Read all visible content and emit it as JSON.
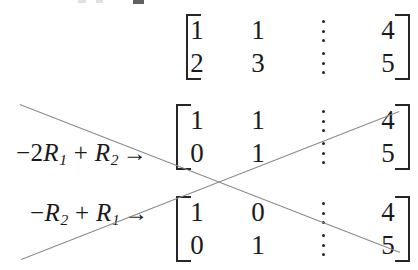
{
  "page": {
    "background_color": "#ffffff",
    "text_color": "#1a1a1a",
    "line_color": "#8a8a8a",
    "bracket_color": "#262626",
    "width": 418,
    "height": 270
  },
  "blocks": [
    {
      "id": "matrix-1",
      "label": "",
      "label_arrow": "",
      "rows": [
        {
          "c1": "1",
          "c2": "1",
          "sep": "dots",
          "c3": "4"
        },
        {
          "c1": "2",
          "c2": "3",
          "sep": "dots",
          "c3": "5"
        }
      ]
    },
    {
      "id": "matrix-2",
      "label_minus": "−",
      "label_coef": "2",
      "label_r_a": "R",
      "label_sub_a": "1",
      "label_plus": "+",
      "label_r_b": "R",
      "label_sub_b": "2",
      "label_arrow": "→",
      "rows": [
        {
          "c1": "1",
          "c2": "1",
          "sep": "dots",
          "c3": "4"
        },
        {
          "c1": "0",
          "c2": "1",
          "sep": "dots",
          "c3": "5"
        }
      ]
    },
    {
      "id": "matrix-3",
      "label_minus": "−",
      "label_coef": "",
      "label_r_a": "R",
      "label_sub_a": "2",
      "label_plus": "+",
      "label_r_b": "R",
      "label_sub_b": "1",
      "label_arrow": "→",
      "rows": [
        {
          "c1": "1",
          "c2": "0",
          "sep": "dots",
          "c3": "4"
        },
        {
          "c1": "0",
          "c2": "1",
          "sep": "dots",
          "c3": "5"
        }
      ]
    }
  ],
  "annotations": {
    "strike_lines": [
      {
        "name": "descending-strike-line",
        "x1": 20,
        "y1": 104,
        "x2": 400,
        "y2": 252
      },
      {
        "name": "ascending-strike-line",
        "x1": 21,
        "y1": 259,
        "x2": 399,
        "y2": 111
      }
    ]
  }
}
